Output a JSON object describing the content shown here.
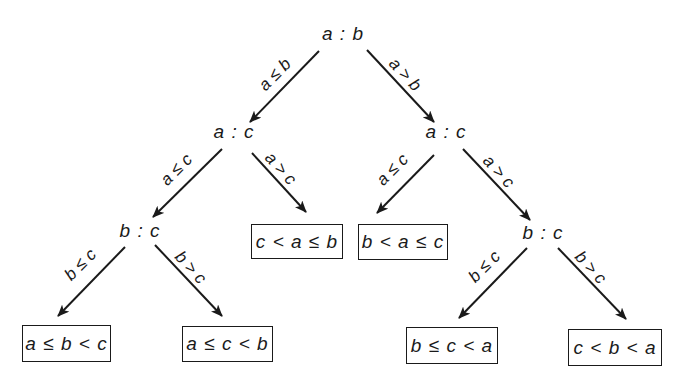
{
  "diagram": {
    "type": "decision-tree",
    "title": "",
    "nodes": {
      "root": "a : b",
      "left_ac": "a : c",
      "right_ac": "a : c",
      "left_bc": "b : c",
      "right_bc": "b : c"
    },
    "edges": {
      "root_left": "a ≤ b",
      "root_right": "a > b",
      "left_ac_left": "a ≤ c",
      "left_ac_right": "a > c",
      "right_ac_left": "a ≤ c",
      "right_ac_right": "a > c",
      "left_bc_left": "b ≤ c",
      "left_bc_right": "b > c",
      "right_bc_left": "b ≤ c",
      "right_bc_right": "b > c"
    },
    "leaves": {
      "c_a_b": "c < a ≤ b",
      "b_a_c": "b < a ≤ c",
      "a_b_c": "a ≤ b < c",
      "a_c_b": "a ≤ c < b",
      "b_c_a": "b ≤ c < a",
      "c_b_a": "c < b < a"
    },
    "colors": {
      "ink": "#1a1a1a",
      "background": "#ffffff"
    }
  }
}
